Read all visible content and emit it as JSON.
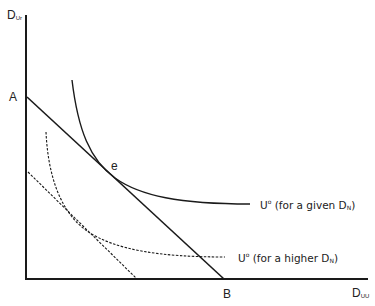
{
  "figure": {
    "y_axis": {
      "label_main": "D",
      "label_sub": "Ur"
    },
    "x_axis": {
      "label_main": "D",
      "label_sub": "UU"
    },
    "points": {
      "A": "A",
      "B": "B",
      "e": "e"
    },
    "curves": [
      {
        "id": "solid-indifference",
        "label_main": "U",
        "label_sup": "o",
        "label_rest": " (for a given D",
        "label_sub": "N",
        "label_end": ")",
        "style": "solid"
      },
      {
        "id": "dashed-indifference",
        "label_main": "U",
        "label_sup": "o",
        "label_rest": " (for a higher D",
        "label_sub": "N",
        "label_end": ")",
        "style": "dashed"
      }
    ],
    "lines": [
      {
        "id": "budget-line-AB",
        "style": "solid",
        "from": "A",
        "to": "B"
      },
      {
        "id": "budget-line-shifted",
        "style": "dashed"
      }
    ],
    "colors": {
      "ink": "#1a1a1a",
      "background": "#ffffff"
    }
  }
}
